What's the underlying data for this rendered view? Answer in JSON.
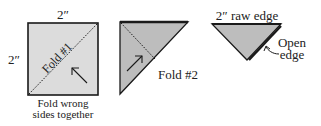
{
  "step1": {
    "top_dim": "2″",
    "side_dim": "2″",
    "fold_label": "Fold #1",
    "caption_line1": "Fold wrong",
    "caption_line2": "sides together"
  },
  "step2": {
    "fold_label": "Fold #2"
  },
  "step3": {
    "top_label": "2″ raw edge",
    "open_line1": "Open",
    "open_line2": "edge"
  },
  "colors": {
    "fabric": "#bdbdbd",
    "fabric_light": "#dcdcdc",
    "outline": "#1a1a1a"
  }
}
